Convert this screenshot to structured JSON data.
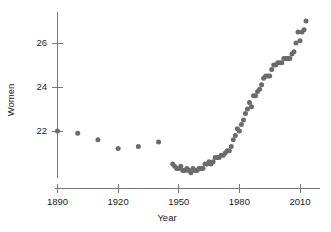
{
  "chart_data": {
    "type": "scatter",
    "title": "",
    "xlabel": "Year",
    "ylabel": "Women",
    "xlim": [
      1883,
      2017
    ],
    "ylim": [
      19.9,
      27.4
    ],
    "grid": false,
    "legend": null,
    "marker_color": "#6b6b6b",
    "axis_color": "#777777",
    "xticks": [
      1890,
      1920,
      1950,
      1980,
      2010
    ],
    "xtick_labels": [
      "1890",
      "1920",
      "1950",
      "1980",
      "2010"
    ],
    "yticks": [
      22,
      24,
      26
    ],
    "ytick_labels": [
      "22",
      "24",
      "26"
    ],
    "series": [
      {
        "name": "Women",
        "x": [
          1890,
          1900,
          1910,
          1920,
          1930,
          1940,
          1947,
          1948,
          1949,
          1950,
          1951,
          1952,
          1953,
          1954,
          1955,
          1956,
          1957,
          1958,
          1959,
          1960,
          1961,
          1962,
          1963,
          1964,
          1965,
          1966,
          1967,
          1968,
          1969,
          1970,
          1971,
          1972,
          1973,
          1974,
          1975,
          1976,
          1977,
          1978,
          1979,
          1980,
          1981,
          1982,
          1983,
          1984,
          1985,
          1986,
          1987,
          1988,
          1989,
          1990,
          1991,
          1992,
          1993,
          1994,
          1995,
          1996,
          1997,
          1998,
          1999,
          2000,
          2001,
          2002,
          2003,
          2004,
          2005,
          2006,
          2007,
          2008,
          2009,
          2010,
          2011,
          2012,
          2013
        ],
        "y": [
          22.0,
          21.9,
          21.6,
          21.2,
          21.3,
          21.5,
          20.5,
          20.4,
          20.3,
          20.3,
          20.4,
          20.2,
          20.2,
          20.3,
          20.2,
          20.1,
          20.3,
          20.2,
          20.2,
          20.3,
          20.3,
          20.3,
          20.5,
          20.5,
          20.6,
          20.5,
          20.6,
          20.8,
          20.8,
          20.8,
          20.9,
          20.9,
          21.0,
          21.1,
          21.1,
          21.3,
          21.6,
          21.8,
          22.1,
          22.0,
          22.3,
          22.5,
          22.8,
          23.0,
          23.3,
          23.1,
          23.6,
          23.6,
          23.8,
          23.9,
          24.1,
          24.4,
          24.5,
          24.5,
          24.5,
          24.8,
          25.0,
          25.0,
          25.1,
          25.1,
          25.1,
          25.3,
          25.3,
          25.3,
          25.3,
          25.5,
          25.6,
          26.0,
          26.5,
          26.1,
          26.5,
          26.6,
          27.0
        ]
      }
    ]
  },
  "figure": {
    "x_axis_title": "Year",
    "y_axis_title": "Women"
  }
}
